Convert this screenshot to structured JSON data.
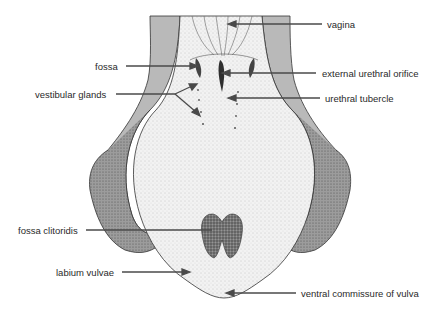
{
  "diagram": {
    "colors": {
      "background": "#ffffff",
      "outer_tissue": "#b9b9b9",
      "inner_mucosa": "#f1f1f1",
      "labia_dark": "#8f8f8f",
      "outline": "#333333",
      "leader_line": "#4a4a4a",
      "fossa_clitoridis": "#555555"
    },
    "labels": {
      "vagina": "vagina",
      "fossa": "fossa",
      "external_urethral_orifice": "external urethral orifice",
      "vestibular_glands": "vestibular glands",
      "urethral_tubercle": "urethral tubercle",
      "fossa_clitoridis": "fossa clitoridis",
      "labium_vulvae": "labium vulvae",
      "ventral_commissure_of_vulva": "ventral commissure of vulva"
    }
  }
}
